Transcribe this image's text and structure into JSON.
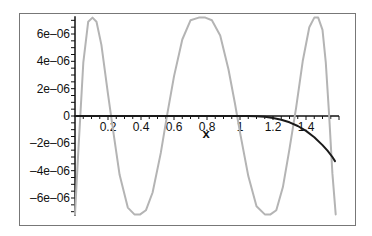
{
  "chart_data": {
    "type": "line",
    "title": "",
    "xlabel": "x",
    "ylabel": "",
    "xlim": [
      0,
      1.6
    ],
    "ylim": [
      -7.3e-06,
      7.3e-06
    ],
    "grid": false,
    "legend": null,
    "x_ticks": [
      {
        "value": 0.2,
        "label": "0.2"
      },
      {
        "value": 0.4,
        "label": "0.4"
      },
      {
        "value": 0.6,
        "label": "0.6"
      },
      {
        "value": 0.8,
        "label": "0.8"
      },
      {
        "value": 1.0,
        "label": "1"
      },
      {
        "value": 1.2,
        "label": "1.2"
      },
      {
        "value": 1.4,
        "label": "1.4"
      }
    ],
    "y_ticks": [
      {
        "value": 6e-06,
        "label": "6e–06"
      },
      {
        "value": 4e-06,
        "label": "4e–06"
      },
      {
        "value": 2e-06,
        "label": "2e–06"
      },
      {
        "value": 0,
        "label": "0"
      },
      {
        "value": -2e-06,
        "label": "–2e–06"
      },
      {
        "value": -4e-06,
        "label": "–4e–06"
      },
      {
        "value": -6e-06,
        "label": "–6e–06"
      }
    ],
    "series": [
      {
        "name": "gray-oscillating-error",
        "color": "#b4b4b4",
        "width": 2,
        "x": [
          0.0,
          0.02,
          0.05,
          0.08,
          0.106,
          0.13,
          0.16,
          0.2,
          0.23,
          0.27,
          0.32,
          0.36,
          0.395,
          0.43,
          0.47,
          0.52,
          0.56,
          0.6,
          0.65,
          0.7,
          0.75,
          0.79,
          0.83,
          0.88,
          0.93,
          0.97,
          1.0,
          1.05,
          1.1,
          1.15,
          1.185,
          1.22,
          1.26,
          1.3,
          1.34,
          1.38,
          1.42,
          1.45,
          1.474,
          1.5,
          1.52,
          1.54,
          1.56,
          1.58
        ],
        "y": [
          -7.2e-06,
          -2.6e-06,
          3.9e-06,
          6.9e-06,
          7.2e-06,
          6.9e-06,
          5.2e-06,
          1.6e-06,
          -1e-06,
          -4.3e-06,
          -6.7e-06,
          -7.2e-06,
          -7.2e-06,
          -6.9e-06,
          -5.6e-06,
          -2.7e-06,
          2e-07,
          2.9e-06,
          5.6e-06,
          7e-06,
          7.2e-06,
          7.2e-06,
          7e-06,
          5.9e-06,
          3.4e-06,
          9e-07,
          -1.2e-06,
          -4.4e-06,
          -6.6e-06,
          -7.2e-06,
          -7.2e-06,
          -6.9e-06,
          -5.2e-06,
          -2.4e-06,
          6e-07,
          4e-06,
          6.5e-06,
          7.2e-06,
          7.2e-06,
          6.3e-06,
          3.9e-06,
          1e-07,
          -4.2e-06,
          -7.2e-06
        ]
      },
      {
        "name": "black-error",
        "color": "#1a1a1a",
        "width": 2,
        "x": [
          0.0,
          0.2,
          0.4,
          0.6,
          0.8,
          1.0,
          1.05,
          1.1,
          1.15,
          1.2,
          1.25,
          1.3,
          1.35,
          1.4,
          1.45,
          1.5,
          1.53,
          1.56,
          1.576
        ],
        "y": [
          0,
          0,
          0,
          0,
          0,
          0,
          -2e-09,
          -1.7e-08,
          -6e-08,
          -1.4e-07,
          -2.7e-07,
          -4.6e-07,
          -7.3e-07,
          -1.09e-06,
          -1.55e-06,
          -2.13e-06,
          -2.54e-06,
          -3e-06,
          -3.3e-06
        ]
      }
    ]
  }
}
